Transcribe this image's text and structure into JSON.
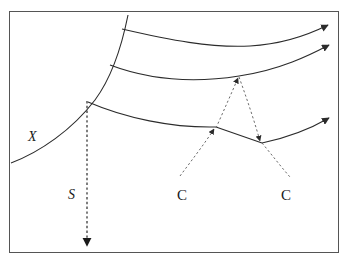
{
  "figure": {
    "type": "line-diagram",
    "background_color": "#ffffff",
    "stroke_color": "#2b2b2b",
    "border": {
      "name": "figure-border",
      "color": "#555555",
      "width_px": 1,
      "rect": {
        "x": 9,
        "y": 11,
        "w": 330,
        "h": 242
      }
    },
    "labels": [
      {
        "id": "x",
        "text": "X",
        "x": 28,
        "y": 130,
        "italic": true
      },
      {
        "id": "s",
        "text": "S",
        "x": 68,
        "y": 188,
        "italic": true
      },
      {
        "id": "c1",
        "text": "C",
        "x": 177,
        "y": 188,
        "italic": false
      },
      {
        "id": "c2",
        "text": "C",
        "x": 281,
        "y": 188,
        "italic": false
      }
    ],
    "curves": [
      {
        "id": "shock-front",
        "label": "X",
        "style": "solid",
        "arrow": "none",
        "path": "M 11,163 C 40,152 72,130 95,100 C 112,77 122,45 128,15"
      },
      {
        "id": "characteristic-top",
        "style": "solid",
        "arrow": "end",
        "path": "M 122,29 C 170,40 210,48 250,46 C 285,44 310,34 330,24"
      },
      {
        "id": "characteristic-middle",
        "style": "solid",
        "arrow": "end",
        "path": "M 110,65 C 150,80 195,83 239,76 C 280,70 312,54 331,44"
      },
      {
        "id": "characteristic-lower-left",
        "style": "solid",
        "arrow": "none",
        "path": "M 88,102 C 125,118 170,128 216,127"
      },
      {
        "id": "characteristic-lower-middle",
        "style": "solid",
        "arrow": "none",
        "path": "M 216,127 L 262,143"
      },
      {
        "id": "characteristic-lower-right",
        "style": "solid",
        "arrow": "end",
        "path": "M 262,143 C 285,138 310,128 331,117"
      }
    ],
    "dashed_lines": [
      {
        "id": "s-vertical",
        "label": "S",
        "style": "dashed",
        "arrow": "end",
        "path": "M 87,101 L 87,249"
      },
      {
        "id": "c-left",
        "label": "C",
        "style": "dashed",
        "arrow": "end",
        "path": "M 180,176 C 192,160 205,143 216,128"
      },
      {
        "id": "c-apex-left",
        "style": "dashed",
        "arrow": "end",
        "path": "M 216,128 C 224,110 232,92 239,77"
      },
      {
        "id": "c-apex-right",
        "style": "dashed",
        "arrow": "end",
        "path": "M 239,77 C 247,99 255,121 262,143"
      },
      {
        "id": "c-right",
        "style": "dashed",
        "arrow": "none",
        "path": "M 262,143 C 272,155 282,168 290,177"
      }
    ]
  }
}
